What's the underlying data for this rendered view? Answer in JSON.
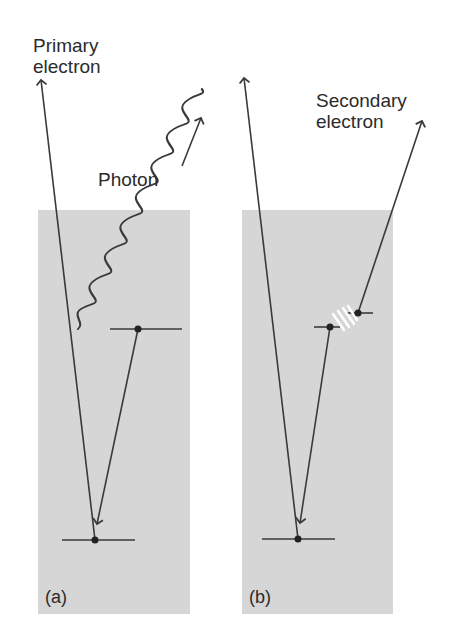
{
  "diagram": {
    "panels": [
      {
        "id": "a",
        "label": "(a)",
        "primary_label_line1": "Primary",
        "primary_label_line2": "electron",
        "photon_label": "Photon"
      },
      {
        "id": "b",
        "label": "(b)",
        "secondary_label_line1": "Secondary",
        "secondary_label_line2": "electron"
      }
    ],
    "colors": {
      "panel_fill": "#d6d6d6",
      "line": "#3a3a3a",
      "text": "#2b2b2b",
      "spark": "#ffffff"
    }
  }
}
